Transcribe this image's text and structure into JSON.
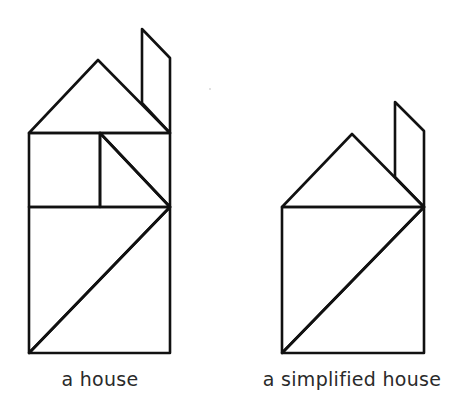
{
  "figure": {
    "stroke_color": "#111111",
    "background": "#ffffff",
    "panels": [
      {
        "id": "house",
        "caption": "a house",
        "pieces": [
          {
            "name": "roof-triangle",
            "points": [
              [
                29,
                133
              ],
              [
                98,
                60
              ],
              [
                170,
                133
              ]
            ]
          },
          {
            "name": "chimney-parallelogram",
            "points": [
              [
                142,
                29
              ],
              [
                170,
                58
              ],
              [
                170,
                133
              ],
              [
                142,
                103
              ]
            ]
          },
          {
            "name": "window-square",
            "points": [
              [
                29,
                133
              ],
              [
                100,
                133
              ],
              [
                100,
                207
              ],
              [
                29,
                207
              ]
            ]
          },
          {
            "name": "small-triangle",
            "points": [
              [
                100,
                133
              ],
              [
                170,
                133
              ],
              [
                170,
                207
              ]
            ],
            "note": "drawn with hypotenuse from (100,133) to (170,207)"
          },
          {
            "name": "small-triangle-2",
            "points": [
              [
                100,
                133
              ],
              [
                100,
                207
              ],
              [
                170,
                207
              ]
            ]
          },
          {
            "name": "large-triangle-upper",
            "points": [
              [
                29,
                207
              ],
              [
                170,
                207
              ],
              [
                29,
                353
              ]
            ]
          },
          {
            "name": "large-triangle-lower",
            "points": [
              [
                170,
                207
              ],
              [
                170,
                353
              ],
              [
                29,
                353
              ]
            ]
          }
        ]
      },
      {
        "id": "simplified-house",
        "caption": "a simplified house",
        "pieces": [
          {
            "name": "roof-triangle",
            "points": [
              [
                282,
                207
              ],
              [
                352,
                134
              ],
              [
                424,
                207
              ]
            ]
          },
          {
            "name": "chimney-parallelogram",
            "points": [
              [
                395,
                102
              ],
              [
                424,
                131
              ],
              [
                424,
                207
              ],
              [
                395,
                177
              ]
            ]
          },
          {
            "name": "large-triangle-upper",
            "points": [
              [
                282,
                207
              ],
              [
                424,
                207
              ],
              [
                282,
                353
              ]
            ]
          },
          {
            "name": "large-triangle-lower",
            "points": [
              [
                424,
                207
              ],
              [
                424,
                353
              ],
              [
                282,
                353
              ]
            ]
          }
        ]
      }
    ]
  },
  "captions": {
    "left": "a house",
    "right": "a simplified house"
  }
}
